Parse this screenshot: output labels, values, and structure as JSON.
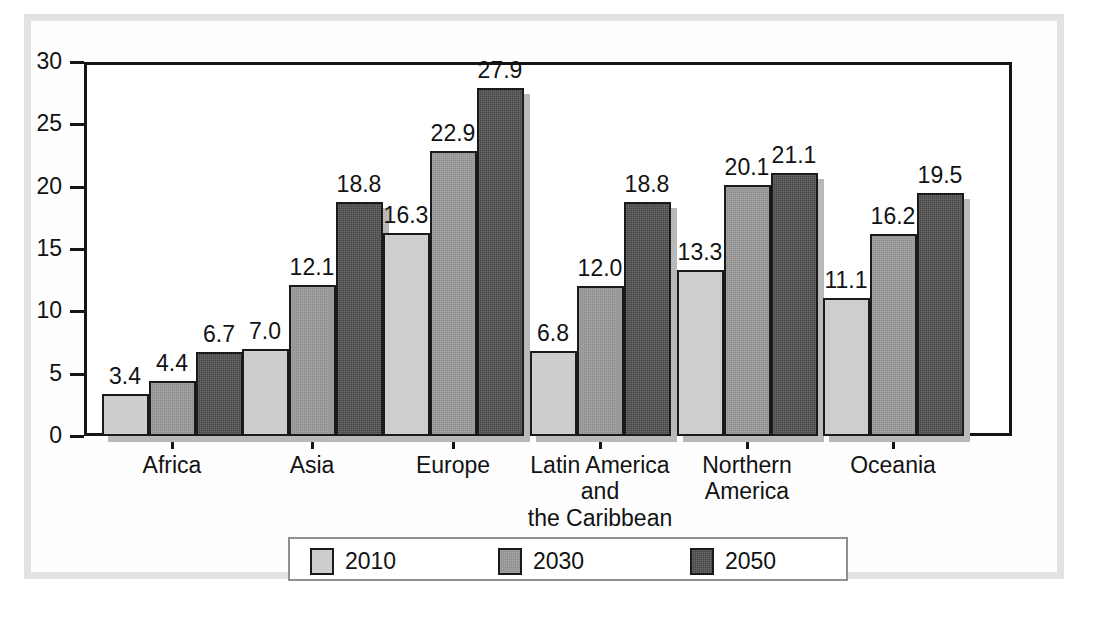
{
  "chart_data": {
    "type": "bar",
    "title": "",
    "subtitle": "",
    "xlabel": "",
    "ylabel": "",
    "ylim": [
      0,
      30
    ],
    "yticks": [
      0,
      5,
      10,
      15,
      20,
      25,
      30
    ],
    "ytick_labels": [
      "0",
      "5",
      "10",
      "15",
      "20",
      "25",
      "30"
    ],
    "grid": false,
    "legend_position": "bottom",
    "categories": [
      "Africa",
      "Asia",
      "Europe",
      "Latin America\nand\nthe Caribbean",
      "Northern\nAmerica",
      "Oceania"
    ],
    "category_lines": [
      [
        "Africa"
      ],
      [
        "Asia"
      ],
      [
        "Europe"
      ],
      [
        "Latin America",
        "and",
        "the Caribbean"
      ],
      [
        "Northern",
        "America"
      ],
      [
        "Oceania"
      ]
    ],
    "series": [
      {
        "name": "2010",
        "color": "#c8c8c8",
        "values": [
          3.4,
          7.0,
          16.3,
          6.8,
          13.3,
          11.1
        ],
        "labels": [
          "3.4",
          "7.0",
          "16.3",
          "6.8",
          "13.3",
          "11.1"
        ]
      },
      {
        "name": "2030",
        "color": "#8e8e8e",
        "values": [
          4.4,
          12.1,
          22.9,
          12.0,
          20.1,
          16.2
        ],
        "labels": [
          "4.4",
          "12.1",
          "22.9",
          "12.0",
          "20.1",
          "16.2"
        ]
      },
      {
        "name": "2050",
        "color": "#454545",
        "values": [
          6.7,
          18.8,
          27.9,
          18.8,
          21.1,
          19.5
        ],
        "labels": [
          "6.7",
          "18.8",
          "27.9",
          "18.8",
          "21.1",
          "19.5"
        ]
      }
    ]
  },
  "legend": {
    "items": [
      {
        "label": "2010",
        "color": "#c8c8c8"
      },
      {
        "label": "2030",
        "color": "#8e8e8e"
      },
      {
        "label": "2050",
        "color": "#454545"
      }
    ]
  },
  "axis": {
    "y_labels": [
      "30",
      "25",
      "20",
      "15",
      "10",
      "5",
      "0"
    ]
  },
  "colors": {
    "series_2010": "#c8c8c8",
    "series_2030": "#8e8e8e",
    "series_2050": "#454545",
    "axis_line": "#151515",
    "text": "#121212",
    "page_frame": "#e2e2e2",
    "bar_shadow": "#b9b9b9"
  }
}
